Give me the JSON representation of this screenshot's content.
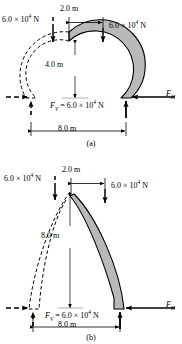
{
  "figure": {
    "type": "physics-arch-diagram",
    "panels": [
      {
        "id": "a",
        "caption": "(a)",
        "shape": "semicircular arch",
        "labels": {
          "top_width": "2.0 m",
          "height": "4.0 m",
          "span": "8.0 m",
          "load_left": "6.0 × 10",
          "load_left_exp": "4",
          "load_left_unit": " N",
          "load_right": "6.0 × 10",
          "load_right_exp": "4",
          "load_right_unit": " N",
          "fv_symbol": "F",
          "fv_sub": "V",
          "fv_value": " = 6.0 × 10",
          "fv_exp": "4",
          "fv_unit": " N",
          "fh_symbol": "F",
          "fh_sub": "H"
        }
      },
      {
        "id": "b",
        "caption": "(b)",
        "shape": "pointed gothic arch",
        "labels": {
          "top_width": "2.0 m",
          "height": "8.0 m",
          "span": "8.0 m",
          "load_left": "6.0 × 10",
          "load_left_exp": "4",
          "load_left_unit": " N",
          "load_right": "6.0 × 10",
          "load_right_exp": "4",
          "load_right_unit": " N",
          "fv_symbol": "F",
          "fv_sub": "V",
          "fv_value": " = 6.0 × 10",
          "fv_exp": "4",
          "fv_unit": " N",
          "fh_symbol": "F",
          "fh_sub": "H"
        }
      }
    ],
    "colors": {
      "arch_fill": "#b9b9b9",
      "stroke": "#000000",
      "thin_line": "#808080",
      "background": "#ffffff"
    }
  }
}
